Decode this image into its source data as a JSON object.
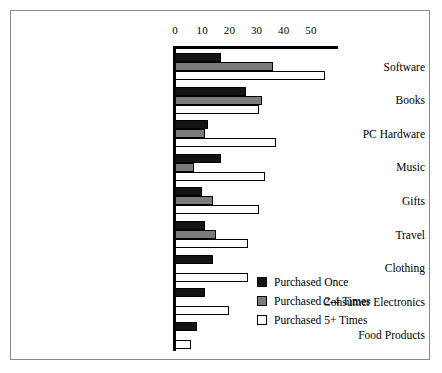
{
  "chart_data": {
    "type": "bar",
    "orientation": "horizontal",
    "title": "",
    "xlabel": "",
    "ylabel": "",
    "xlim": [
      0,
      55
    ],
    "xticks": [
      0,
      10,
      20,
      30,
      40,
      50
    ],
    "xtick_labels": [
      "0",
      "10",
      "20",
      "30",
      "40",
      "50"
    ],
    "grid": false,
    "legend_position": "lower-right",
    "categories": [
      "Software",
      "Books",
      "PC Hardware",
      "Music",
      "Gifts",
      "Travel",
      "Clothing",
      "Consumer Electronics",
      "Food Products"
    ],
    "series": [
      {
        "name": "Purchased Once",
        "color": "#141414",
        "values": [
          17,
          26,
          12,
          17,
          10,
          11,
          14,
          11,
          8
        ]
      },
      {
        "name": "Purchased 2-4 Times",
        "color": "#7b7b7b",
        "values": [
          36,
          32,
          11,
          7,
          14,
          15,
          0,
          0,
          0
        ]
      },
      {
        "name": "Purchased 5+ Times",
        "color": "#ffffff",
        "values": [
          55,
          31,
          37,
          33,
          31,
          27,
          27,
          20,
          6
        ]
      }
    ]
  },
  "legend": {
    "entries": [
      "Purchased Once",
      "Purchased 2-4 Times",
      "Purchased 5+ Times"
    ]
  }
}
